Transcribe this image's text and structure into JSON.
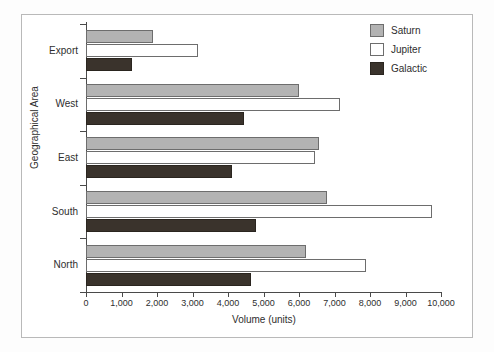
{
  "chart_data": {
    "type": "bar",
    "orientation": "horizontal",
    "title": "",
    "xlabel": "Volume (units)",
    "ylabel": "Geographical Area",
    "categories": [
      "Export",
      "West",
      "East",
      "South",
      "North"
    ],
    "series": [
      {
        "name": "Saturn",
        "color": "#b3b3b3",
        "values": [
          1900,
          6000,
          6550,
          6800,
          6200
        ]
      },
      {
        "name": "Jupiter",
        "color": "#ffffff",
        "values": [
          3150,
          7150,
          6450,
          9750,
          7900
        ]
      },
      {
        "name": "Galactic",
        "color": "#3a332c",
        "values": [
          1300,
          4450,
          4100,
          4800,
          4650
        ]
      }
    ],
    "xlim": [
      0,
      10000
    ],
    "xticks": [
      0,
      1000,
      2000,
      3000,
      4000,
      5000,
      6000,
      7000,
      8000,
      9000,
      10000
    ],
    "xtick_labels": [
      "0",
      "1,000",
      "2,000",
      "3,000",
      "4,000",
      "5,000",
      "6,000",
      "7,000",
      "8,000",
      "9,000",
      "10,000"
    ],
    "grid": false,
    "legend_position": "top-right"
  },
  "legend": {
    "entries": [
      {
        "label": "Saturn",
        "swatch": "saturn"
      },
      {
        "label": "Jupiter",
        "swatch": "jupiter"
      },
      {
        "label": "Galactic",
        "swatch": "galactic"
      }
    ]
  }
}
